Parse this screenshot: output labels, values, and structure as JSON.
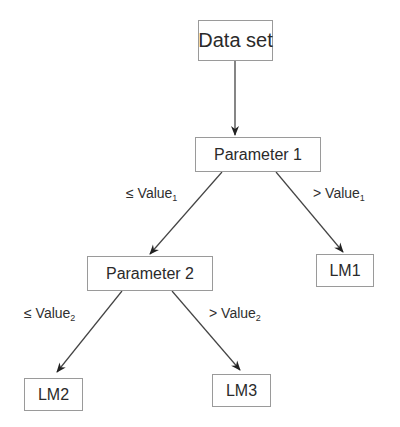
{
  "diagram": {
    "type": "decision-tree",
    "nodes": {
      "root": {
        "label": "Data set"
      },
      "param1": {
        "label": "Parameter 1"
      },
      "param2": {
        "label": "Parameter 2"
      },
      "lm1": {
        "label": "LM1"
      },
      "lm2": {
        "label": "LM2"
      },
      "lm3": {
        "label": "LM3"
      }
    },
    "edges": {
      "p1_left": {
        "op": "≤",
        "text": "Value",
        "sub": "1"
      },
      "p1_right": {
        "op": ">",
        "text": "Value",
        "sub": "1"
      },
      "p2_left": {
        "op": "≤",
        "text": "Value",
        "sub": "2"
      },
      "p2_right": {
        "op": ">",
        "text": "Value",
        "sub": "2"
      }
    },
    "colors": {
      "line": "#333333",
      "border": "#9a9a9a",
      "text": "#2a2a2a"
    }
  }
}
